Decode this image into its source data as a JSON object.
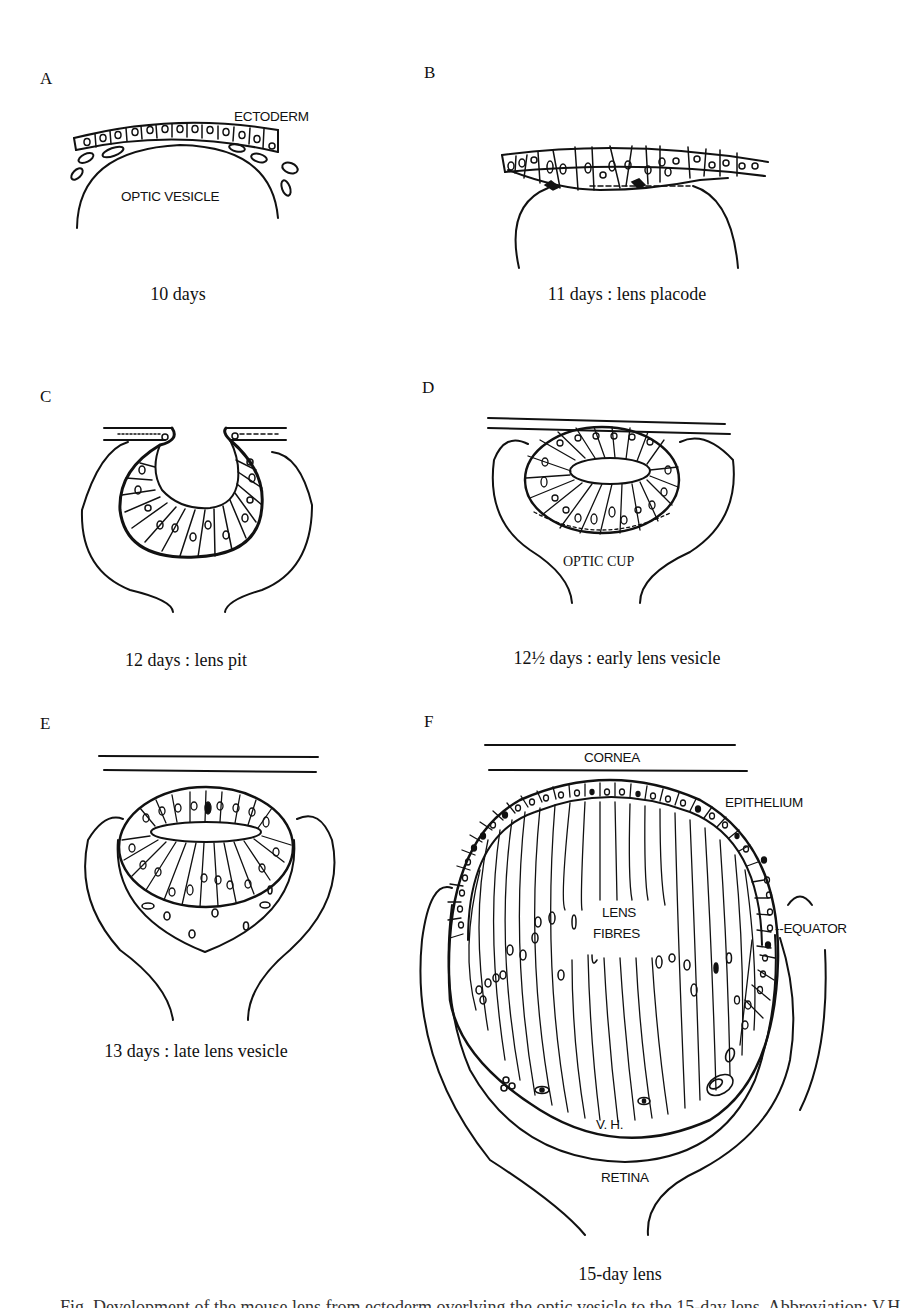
{
  "figure": {
    "panels": [
      {
        "id": "A",
        "letter": "A",
        "caption": "10 days",
        "labels": {
          "ectoderm": "ECTODERM",
          "optic_vesicle": "OPTIC VESICLE"
        }
      },
      {
        "id": "B",
        "letter": "B",
        "caption": "11 days : lens placode",
        "labels": {}
      },
      {
        "id": "C",
        "letter": "C",
        "caption": "12 days : lens pit",
        "labels": {}
      },
      {
        "id": "D",
        "letter": "D",
        "caption": "12½ days : early lens vesicle",
        "labels": {
          "optic_cup": "OPTIC CUP"
        }
      },
      {
        "id": "E",
        "letter": "E",
        "caption": "13 days : late lens vesicle",
        "labels": {}
      },
      {
        "id": "F",
        "letter": "F",
        "caption": "15-day lens",
        "labels": {
          "cornea": "CORNEA",
          "epithelium": "EPITHELIUM",
          "lens_fibres_1": "LENS",
          "lens_fibres_2": "FIBRES",
          "equator": "--EQUATOR",
          "vh": "V. H.",
          "retina": "RETINA"
        }
      }
    ],
    "cutoff_caption": "Fig. Development of the mouse lens from ectoderm overlying the optic vesicle to the 15-day lens. Abbreviation: V.H."
  }
}
